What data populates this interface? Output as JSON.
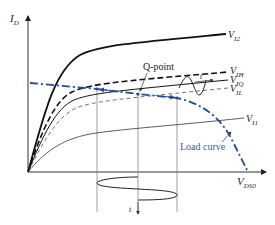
{
  "diagram": {
    "type": "MOSFET output characteristics with load curve",
    "colors": {
      "curve": "#111111",
      "thin": "#555555",
      "load_curve": "#1f4aa0",
      "load_label": "#3a5a9a",
      "grid": "#777777"
    },
    "axes": {
      "y_label": {
        "main": "I",
        "sub": "D"
      },
      "x_label": {
        "main": "V",
        "sub": "DS0"
      }
    },
    "curves": [
      {
        "id": "VI2",
        "label_main": "V",
        "label_sub": "I2",
        "style": "solid-thick"
      },
      {
        "id": "VIH",
        "label_main": "V",
        "label_sub": "IH",
        "style": "dashed-thick"
      },
      {
        "id": "VIQ",
        "label_main": "V",
        "label_sub": "IQ",
        "style": "solid"
      },
      {
        "id": "VIL",
        "label_main": "V",
        "label_sub": "IL",
        "style": "dashed-thin"
      },
      {
        "id": "VI1",
        "label_main": "V",
        "label_sub": "I1",
        "style": "solid-thin"
      }
    ],
    "annotations": {
      "q_point": "Q-point",
      "load_curve": "Load curve",
      "time_right": "t",
      "time_bottom": "t"
    }
  }
}
